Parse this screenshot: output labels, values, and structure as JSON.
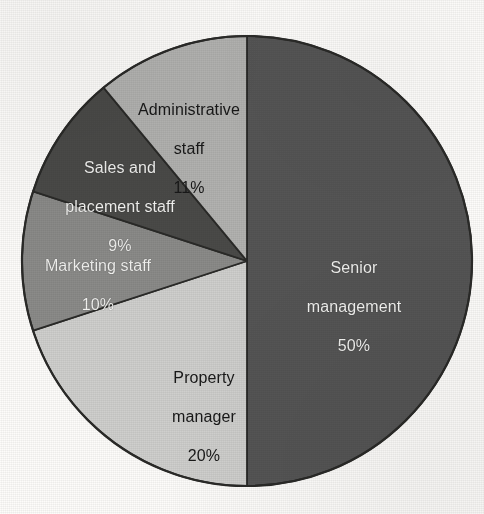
{
  "chart_data": {
    "type": "pie",
    "title": "",
    "subtitle": "",
    "xlabel": "",
    "ylabel": "",
    "legend_position": "none",
    "grid": false,
    "labels_inside_slices": true,
    "value_unit": "%",
    "start_angle_deg": 0,
    "direction": "clockwise",
    "categories": [
      "Senior management",
      "Property manager",
      "Marketing staff",
      "Sales and placement staff",
      "Administrative staff"
    ],
    "values": [
      50,
      20,
      10,
      9,
      11
    ],
    "total": 100,
    "slices": [
      {
        "label": "Senior management",
        "label_line1": "Senior",
        "label_line2": "management",
        "value": 50,
        "value_text": "50%",
        "color": "#555555",
        "text_color": "#f4f4f2",
        "start_deg": 0,
        "end_deg": 180
      },
      {
        "label": "Property manager",
        "label_line1": "Property",
        "label_line2": "manager",
        "value": 20,
        "value_text": "20%",
        "color": "#cfcfcd",
        "text_color": "#181818",
        "start_deg": 180,
        "end_deg": 252
      },
      {
        "label": "Marketing staff",
        "label_line1": "Marketing staff",
        "label_line2": "",
        "value": 10,
        "value_text": "10%",
        "color": "#8b8b89",
        "text_color": "#f4f4f2",
        "start_deg": 252,
        "end_deg": 288
      },
      {
        "label": "Sales and placement staff",
        "label_line1": "Sales and",
        "label_line2": "placement staff",
        "value": 9,
        "value_text": "9%",
        "color": "#4a4a48",
        "text_color": "#f4f4f2",
        "start_deg": 288,
        "end_deg": 320.4
      },
      {
        "label": "Administrative staff",
        "label_line1": "Administrative",
        "label_line2": "staff",
        "value": 11,
        "value_text": "11%",
        "color": "#b2b2b0",
        "text_color": "#181818",
        "start_deg": 320.4,
        "end_deg": 360
      }
    ],
    "geometry": {
      "center_x": 247,
      "center_y": 261,
      "radius": 225
    },
    "colors": {
      "background": "#fdfcfa",
      "outline": "#2a2a28"
    }
  }
}
